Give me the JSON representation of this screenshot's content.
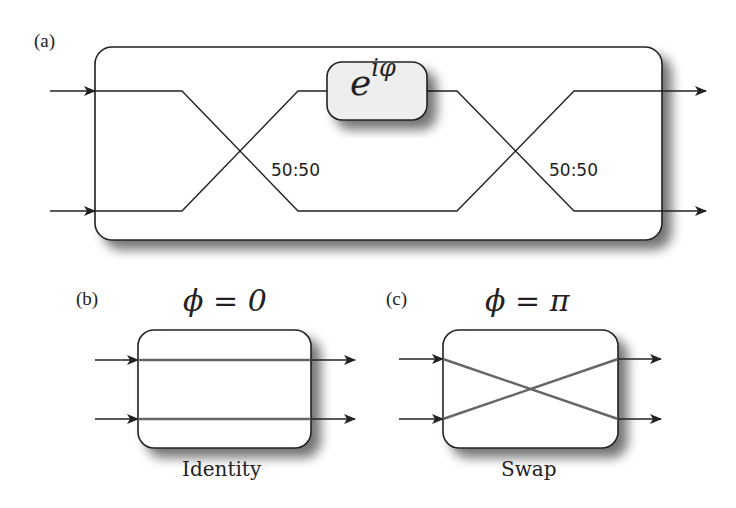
{
  "figure": {
    "panel_a": {
      "label": "(a)",
      "phase_shifter": {
        "text_base": "e",
        "text_exp": "iφ"
      },
      "beam_splitters": [
        {
          "ratio": "50:50"
        },
        {
          "ratio": "50:50"
        }
      ],
      "inputs": 2,
      "outputs": 2
    },
    "panel_b": {
      "label": "(b)",
      "condition": "ϕ = 0",
      "caption": "Identity"
    },
    "panel_c": {
      "label": "(c)",
      "condition": "ϕ = π",
      "caption": "Swap"
    }
  },
  "colors": {
    "line": "#222222",
    "box_fill": "#ffffff",
    "phase_fill": "#eeeeee",
    "rail_b_c": "#666666",
    "shadow": "#9a9a9a"
  }
}
